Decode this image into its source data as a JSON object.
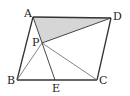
{
  "diagram": {
    "title": "",
    "shape": "parallelogram ABCD with interior point P on segment AE",
    "points": {
      "A": {
        "label": "A",
        "x": 33,
        "y": 17,
        "label_x": 24,
        "label_y": 17
      },
      "D": {
        "label": "D",
        "x": 111,
        "y": 18,
        "label_x": 113,
        "label_y": 20
      },
      "B": {
        "label": "B",
        "x": 17,
        "y": 80,
        "label_x": 7,
        "label_y": 84
      },
      "C": {
        "label": "C",
        "x": 97,
        "y": 80,
        "label_x": 99,
        "label_y": 84
      },
      "E": {
        "label": "E",
        "x": 55,
        "y": 80,
        "label_x": 52,
        "label_y": 92
      },
      "P": {
        "label": "P",
        "x": 42,
        "y": 43,
        "label_x": 32,
        "label_y": 46
      }
    },
    "segments": [
      [
        "A",
        "D"
      ],
      [
        "D",
        "C"
      ],
      [
        "C",
        "B"
      ],
      [
        "B",
        "A"
      ],
      [
        "A",
        "E"
      ],
      [
        "P",
        "D"
      ],
      [
        "P",
        "B"
      ],
      [
        "P",
        "C"
      ]
    ],
    "shaded_region": {
      "vertices": [
        "A",
        "P",
        "D"
      ],
      "color": "#d6d6d6"
    },
    "line_color": "#333333"
  }
}
